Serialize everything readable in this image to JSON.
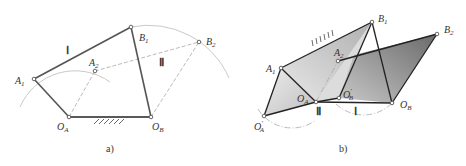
{
  "figure_a": {
    "caption": "a)",
    "points": {
      "A1": {
        "base": "A",
        "sub": "1"
      },
      "A2": {
        "base": "A",
        "sub": "2"
      },
      "B1": {
        "base": "B",
        "sub": "1"
      },
      "B2": {
        "base": "B",
        "sub": "2"
      },
      "OA": {
        "base": "O",
        "sub": "A"
      },
      "OB": {
        "base": "O",
        "sub": "B"
      }
    },
    "position_labels": {
      "first": "Ⅰ",
      "second": "Ⅱ"
    }
  },
  "figure_b": {
    "caption": "b)",
    "points": {
      "A1": {
        "base": "A",
        "sub": "1"
      },
      "A2": {
        "base": "A",
        "sub": "2"
      },
      "B1": {
        "base": "B",
        "sub": "1"
      },
      "B2": {
        "base": "B",
        "sub": "2"
      },
      "OA": {
        "base": "O",
        "sub": "A"
      },
      "OB": {
        "base": "O",
        "sub": "B"
      },
      "OA_prime": {
        "base": "O",
        "sub": "A",
        "prime": "′"
      },
      "OB_prime": {
        "base": "O",
        "sub": "B",
        "prime": "′"
      }
    },
    "position_labels": {
      "second": "Ⅱ",
      "first": "Ⅰ"
    }
  }
}
